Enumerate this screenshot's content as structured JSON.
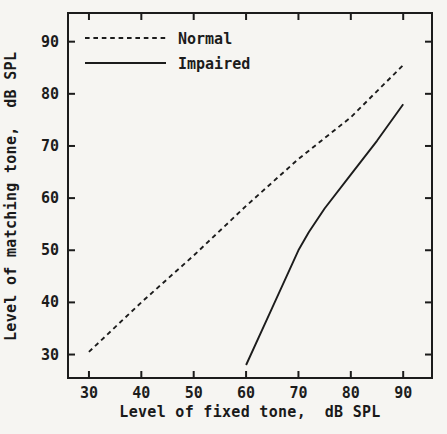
{
  "figure": {
    "background_color": "#f6f5f2",
    "ink_color": "#1c1c1c"
  },
  "chart_data": {
    "type": "line",
    "title": "",
    "xlabel": "Level of fixed tone,  dB SPL",
    "ylabel": "Level of matching tone,  dB SPL",
    "xlim": [
      26,
      95.5
    ],
    "ylim": [
      25.5,
      95.5
    ],
    "xticks": [
      30,
      40,
      50,
      60,
      70,
      80,
      90
    ],
    "yticks": [
      30,
      40,
      50,
      60,
      70,
      80,
      90
    ],
    "grid": false,
    "legend_position": "top-left-inside",
    "legend": [
      "Normal",
      "Impaired"
    ],
    "series": [
      {
        "name": "Normal",
        "style": "dashed",
        "points": [
          [
            30,
            30.5
          ],
          [
            40,
            40
          ],
          [
            50,
            49
          ],
          [
            60,
            58.5
          ],
          [
            70,
            67.5
          ],
          [
            80,
            75.5
          ],
          [
            90,
            85.5
          ]
        ]
      },
      {
        "name": "Impaired",
        "style": "solid",
        "points": [
          [
            60,
            28
          ],
          [
            65,
            39
          ],
          [
            70,
            50
          ],
          [
            72,
            53.5
          ],
          [
            75,
            58
          ],
          [
            80,
            64.5
          ],
          [
            85,
            71
          ],
          [
            90,
            78
          ]
        ]
      }
    ]
  }
}
